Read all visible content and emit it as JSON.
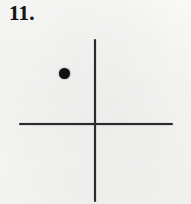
{
  "figure": {
    "problem_number": "11.",
    "ink_color": "#2b2b2b",
    "point_color": "#111111",
    "paper_color": "#f7f7f6"
  },
  "chart_data": {
    "type": "scatter",
    "title": "11.",
    "xlabel": "",
    "ylabel": "",
    "grid": false,
    "legend": false,
    "axis_style": "cross-hair coordinate axes, no tick marks, no labels",
    "origin_px": {
      "x": 95,
      "y": 124
    },
    "x_axis": {
      "start_px": 19,
      "end_px": 173,
      "y_px": 124,
      "thickness_px": 2
    },
    "y_axis": {
      "start_px": 39,
      "end_px": 202,
      "x_px": 95,
      "thickness_px": 2
    },
    "points": [
      {
        "label": "",
        "x": -3,
        "y": 2,
        "px": {
          "x": 64,
          "y": 73
        },
        "marker": "filled-circle",
        "marker_size_px": 11,
        "quadrant": "II"
      }
    ],
    "x": [
      -3
    ],
    "values": [
      2
    ]
  }
}
